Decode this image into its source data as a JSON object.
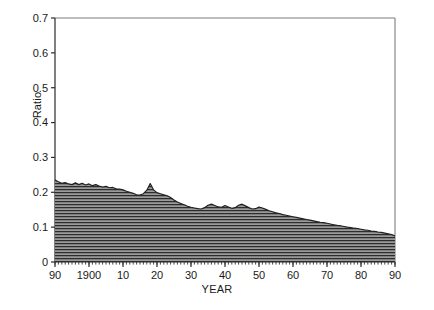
{
  "figure": {
    "background": "#ffffff",
    "ink_color": "#1a1a1a",
    "fill_color": "#8a8a8a",
    "hatch_color": "#2b2b2b"
  },
  "chart_data": {
    "type": "area",
    "title": "",
    "subtitle": "",
    "xlabel": "YEAR",
    "ylabel": "Ratio",
    "xlim": [
      1890,
      1990
    ],
    "ylim": [
      0,
      0.7
    ],
    "grid": false,
    "legend": null,
    "legend_position": "none",
    "fill_style": "horizontal-line-hatch",
    "y_ticks": [
      0,
      0.1,
      0.2,
      0.3,
      0.4,
      0.5,
      0.6,
      0.7
    ],
    "y_tick_labels": [
      "0",
      "0.1",
      "0.2",
      "0.3",
      "0.4",
      "0.5",
      "0.6",
      "0.7"
    ],
    "x_ticks": [
      1890,
      1900,
      1910,
      1920,
      1930,
      1940,
      1950,
      1960,
      1970,
      1980,
      1990
    ],
    "x_tick_labels": [
      "90",
      "1900",
      "10",
      "20",
      "30",
      "40",
      "50",
      "60",
      "70",
      "80",
      "90"
    ],
    "x_minor_tick_interval": 1,
    "x": [
      1890,
      1891,
      1892,
      1893,
      1894,
      1895,
      1896,
      1897,
      1898,
      1899,
      1900,
      1901,
      1902,
      1903,
      1904,
      1905,
      1906,
      1907,
      1908,
      1909,
      1910,
      1911,
      1912,
      1913,
      1914,
      1915,
      1916,
      1917,
      1918,
      1919,
      1920,
      1921,
      1922,
      1923,
      1924,
      1925,
      1926,
      1927,
      1928,
      1929,
      1930,
      1931,
      1932,
      1933,
      1934,
      1935,
      1936,
      1937,
      1938,
      1939,
      1940,
      1941,
      1942,
      1943,
      1944,
      1945,
      1946,
      1947,
      1948,
      1949,
      1950,
      1951,
      1952,
      1953,
      1954,
      1955,
      1956,
      1957,
      1958,
      1959,
      1960,
      1961,
      1962,
      1963,
      1964,
      1965,
      1966,
      1967,
      1968,
      1969,
      1970,
      1971,
      1972,
      1973,
      1974,
      1975,
      1976,
      1977,
      1978,
      1979,
      1980,
      1981,
      1982,
      1983,
      1984,
      1985,
      1986,
      1987,
      1988,
      1989,
      1990
    ],
    "values": [
      0.235,
      0.23,
      0.226,
      0.228,
      0.224,
      0.222,
      0.227,
      0.222,
      0.226,
      0.221,
      0.224,
      0.219,
      0.222,
      0.218,
      0.215,
      0.217,
      0.213,
      0.214,
      0.21,
      0.209,
      0.207,
      0.203,
      0.2,
      0.197,
      0.193,
      0.192,
      0.196,
      0.206,
      0.225,
      0.207,
      0.199,
      0.196,
      0.193,
      0.19,
      0.185,
      0.178,
      0.172,
      0.168,
      0.164,
      0.16,
      0.157,
      0.155,
      0.153,
      0.152,
      0.156,
      0.163,
      0.166,
      0.162,
      0.158,
      0.157,
      0.162,
      0.158,
      0.154,
      0.156,
      0.163,
      0.166,
      0.161,
      0.156,
      0.152,
      0.153,
      0.158,
      0.155,
      0.151,
      0.147,
      0.144,
      0.141,
      0.139,
      0.136,
      0.134,
      0.132,
      0.13,
      0.128,
      0.126,
      0.124,
      0.122,
      0.12,
      0.118,
      0.116,
      0.114,
      0.113,
      0.111,
      0.109,
      0.107,
      0.105,
      0.104,
      0.102,
      0.1,
      0.099,
      0.097,
      0.096,
      0.094,
      0.092,
      0.091,
      0.089,
      0.088,
      0.086,
      0.085,
      0.083,
      0.081,
      0.079,
      0.075
    ],
    "series_name": "Ratio",
    "annotations": []
  }
}
